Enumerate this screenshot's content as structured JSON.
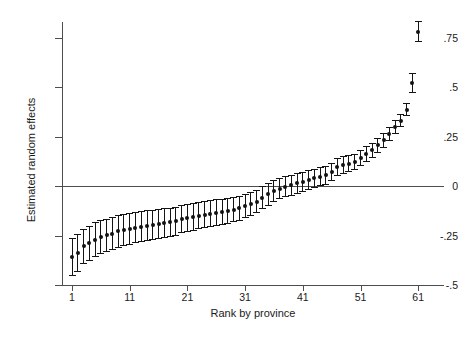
{
  "chart_data": {
    "type": "scatter",
    "title": "",
    "xlabel": "Rank by province",
    "ylabel": "Estimated random effects",
    "xlim": [
      0,
      64
    ],
    "ylim": [
      -0.55,
      0.88
    ],
    "grid": false,
    "legend": "none",
    "yticks": [
      0.75,
      0.5,
      0.25,
      0,
      -0.25,
      -0.5
    ],
    "ytick_labels": [
      ".75",
      ".5",
      ".25",
      "0",
      "-.25",
      "-.5"
    ],
    "xticks": [
      1,
      11,
      21,
      31,
      41,
      51,
      61
    ],
    "xtick_labels": [
      "1",
      "11",
      "21",
      "31",
      "41",
      "51",
      "61"
    ],
    "reference_line": 0,
    "error_bar_type": "95% confidence interval",
    "marker": "filled-circle",
    "series_name": "Estimated random effects",
    "x": [
      1,
      2,
      3,
      4,
      5,
      6,
      7,
      8,
      9,
      10,
      11,
      12,
      13,
      14,
      15,
      16,
      17,
      18,
      19,
      20,
      21,
      22,
      23,
      24,
      25,
      26,
      27,
      28,
      29,
      30,
      31,
      32,
      33,
      34,
      35,
      36,
      37,
      38,
      39,
      40,
      41,
      42,
      43,
      44,
      45,
      46,
      47,
      48,
      49,
      50,
      51,
      52,
      53,
      54,
      55,
      56,
      57,
      58,
      59,
      60,
      61
    ],
    "values": [
      -0.36,
      -0.337,
      -0.305,
      -0.289,
      -0.272,
      -0.257,
      -0.25,
      -0.241,
      -0.229,
      -0.221,
      -0.215,
      -0.21,
      -0.205,
      -0.2,
      -0.196,
      -0.192,
      -0.188,
      -0.184,
      -0.178,
      -0.166,
      -0.16,
      -0.155,
      -0.15,
      -0.146,
      -0.14,
      -0.134,
      -0.13,
      -0.126,
      -0.12,
      -0.113,
      -0.103,
      -0.092,
      -0.079,
      -0.06,
      -0.042,
      -0.025,
      -0.013,
      -0.004,
      0.005,
      0.013,
      0.021,
      0.03,
      0.038,
      0.047,
      0.053,
      0.072,
      0.095,
      0.105,
      0.112,
      0.122,
      0.142,
      0.16,
      0.18,
      0.205,
      0.23,
      0.262,
      0.3,
      0.33,
      0.385,
      0.52,
      0.78
    ],
    "ci_lower": [
      -0.455,
      -0.432,
      -0.395,
      -0.378,
      -0.36,
      -0.343,
      -0.335,
      -0.325,
      -0.312,
      -0.303,
      -0.296,
      -0.29,
      -0.284,
      -0.278,
      -0.273,
      -0.268,
      -0.263,
      -0.258,
      -0.251,
      -0.238,
      -0.231,
      -0.225,
      -0.219,
      -0.214,
      -0.207,
      -0.2,
      -0.195,
      -0.19,
      -0.183,
      -0.175,
      -0.164,
      -0.152,
      -0.138,
      -0.118,
      -0.099,
      -0.081,
      -0.068,
      -0.058,
      -0.048,
      -0.039,
      -0.03,
      -0.02,
      -0.011,
      -0.001,
      0.006,
      0.026,
      0.05,
      0.061,
      0.069,
      0.08,
      0.101,
      0.12,
      0.141,
      0.167,
      0.193,
      0.226,
      0.265,
      0.296,
      0.352,
      0.47,
      0.725
    ],
    "ci_upper": [
      -0.265,
      -0.242,
      -0.215,
      -0.2,
      -0.184,
      -0.171,
      -0.165,
      -0.157,
      -0.146,
      -0.139,
      -0.134,
      -0.13,
      -0.126,
      -0.122,
      -0.119,
      -0.116,
      -0.113,
      -0.11,
      -0.105,
      -0.094,
      -0.089,
      -0.085,
      -0.081,
      -0.078,
      -0.073,
      -0.068,
      -0.065,
      -0.062,
      -0.057,
      -0.051,
      -0.042,
      -0.032,
      -0.02,
      -0.002,
      0.015,
      0.031,
      0.042,
      0.05,
      0.058,
      0.065,
      0.072,
      0.08,
      0.087,
      0.095,
      0.1,
      0.118,
      0.14,
      0.149,
      0.155,
      0.164,
      0.183,
      0.2,
      0.219,
      0.243,
      0.267,
      0.298,
      0.335,
      0.364,
      0.418,
      0.57,
      0.835
    ]
  },
  "colors": {
    "background": "#ffffff",
    "axis": "#4d4d4d",
    "marker": "#111111",
    "error_bar": "#141414",
    "text": "#1a1a1a"
  }
}
